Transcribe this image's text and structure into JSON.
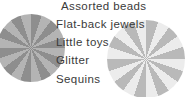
{
  "canvas": {
    "width": 185,
    "height": 97,
    "background": "#ffffff"
  },
  "text_list": {
    "name": "craft-supplies-list",
    "items": [
      {
        "label": "Assorted beads"
      },
      {
        "label": "Flat-back jewels"
      },
      {
        "label": "Little toys"
      },
      {
        "label": "Glitter"
      },
      {
        "label": "Sequins"
      }
    ],
    "text_color": "#3a3a3a"
  },
  "graphics": {
    "pinwheel_left": {
      "name": "pinwheel-left",
      "wedge_count": 20,
      "color_a": "#8e8e8e",
      "color_b": "#b4b4b4",
      "center_x": 31,
      "center_y": 48,
      "radius": 34
    },
    "pinwheel_right": {
      "name": "pinwheel-right",
      "wedge_count": 20,
      "color_a": "#b9b9b9",
      "color_b": "#ececec",
      "center_x": 146,
      "center_y": 59,
      "radius": 39
    }
  }
}
